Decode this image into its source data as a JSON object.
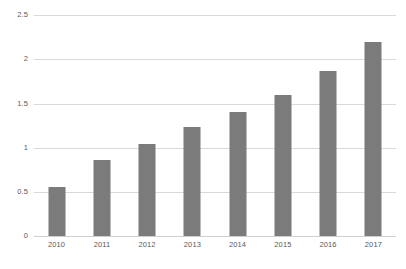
{
  "chart_data": {
    "type": "bar",
    "title": "",
    "subtitle": "",
    "xlabel": "",
    "ylabel": "",
    "categories": [
      "2010",
      "2011",
      "2012",
      "2013",
      "2014",
      "2015",
      "2016",
      "2017"
    ],
    "values": [
      0.55,
      0.86,
      1.04,
      1.23,
      1.4,
      1.6,
      1.87,
      2.2
    ],
    "series": [
      {
        "name": "",
        "values": [
          0.55,
          0.86,
          1.04,
          1.23,
          1.4,
          1.6,
          1.87,
          2.2
        ]
      }
    ],
    "ylim": [
      0,
      2.5
    ],
    "yticks": [
      "0",
      "0.5",
      "1",
      "1.5",
      "2",
      "2.5"
    ],
    "ytick_values": [
      0,
      0.5,
      1,
      1.5,
      2,
      2.5
    ],
    "grid": true,
    "grid_axis": "y",
    "legend": false,
    "legend_position": "none",
    "annotations": [],
    "colors": {
      "bar": "#7b7b7b",
      "grid": "#d9d9d9",
      "baseline": "#d0d0d0",
      "tick_label": "#595959",
      "background": "#ffffff"
    }
  }
}
